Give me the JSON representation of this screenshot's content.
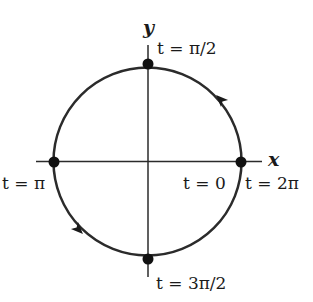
{
  "diagram": {
    "axes": {
      "x_label": "x",
      "y_label": "y"
    },
    "circle": {
      "center": [
        147.5,
        161.5
      ],
      "radius": 94,
      "direction": "counterclockwise",
      "stroke_color": "#2b2b2b"
    },
    "points": [
      {
        "name": "t-zero",
        "label": "t = 0",
        "position": "right"
      },
      {
        "name": "t-two-pi",
        "label": "t = 2π",
        "position": "right"
      },
      {
        "name": "t-pi-over-2",
        "label": "t = π/2",
        "position": "top"
      },
      {
        "name": "t-pi",
        "label": "t = π",
        "position": "left"
      },
      {
        "name": "t-3pi-over-2",
        "label": "t = 3π/2",
        "position": "bottom"
      }
    ],
    "arrows": [
      {
        "name": "arrow-upper-right",
        "direction": "up-left"
      },
      {
        "name": "arrow-lower-left",
        "direction": "down-right"
      }
    ]
  }
}
